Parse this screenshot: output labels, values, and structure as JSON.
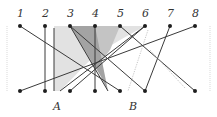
{
  "diagram": {
    "title": "",
    "top_labels": [
      "1",
      "2",
      "3",
      "4",
      "5",
      "6",
      "7",
      "8"
    ],
    "bottom_labels": {
      "A": "A",
      "B": "B"
    },
    "top_y": 26,
    "bottom_y": 91,
    "xs": [
      20,
      45,
      70,
      95,
      120,
      145,
      170,
      195
    ],
    "colors": {
      "line": "#3a3a3a",
      "dot": "#1e1e1e",
      "shade_light": "#dcdcdc",
      "shade_mid": "#bdbdbd",
      "shade_dark": "#9a9a9a",
      "border": "#cfcfcf"
    },
    "connections": [
      {
        "from_top": 1,
        "to_bottom_x": 120
      },
      {
        "from_top": 2,
        "to_bottom_x": 45
      },
      {
        "from_top": 3,
        "to_bottom_x": 145
      },
      {
        "from_top": 4,
        "to_bottom_x": 95
      },
      {
        "from_top": 5,
        "to_bottom_x": 195
      },
      {
        "from_top": 6,
        "to_bottom_x": 70
      },
      {
        "from_top": 7,
        "to_bottom_x": 145
      },
      {
        "from_top": 8,
        "to_bottom_x": 20
      }
    ],
    "extra_vertical_x": 54
  }
}
